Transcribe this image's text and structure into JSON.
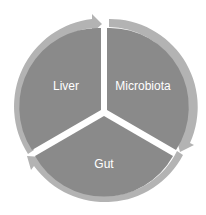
{
  "diagram": {
    "type": "cycle",
    "segments": [
      {
        "label": "Liver"
      },
      {
        "label": "Microbiota"
      },
      {
        "label": "Gut"
      }
    ],
    "colors": {
      "segment_fill": "#8a8a8a",
      "arrow_ring": "#b3b3b3",
      "separator": "#ffffff",
      "text": "#ffffff"
    }
  }
}
